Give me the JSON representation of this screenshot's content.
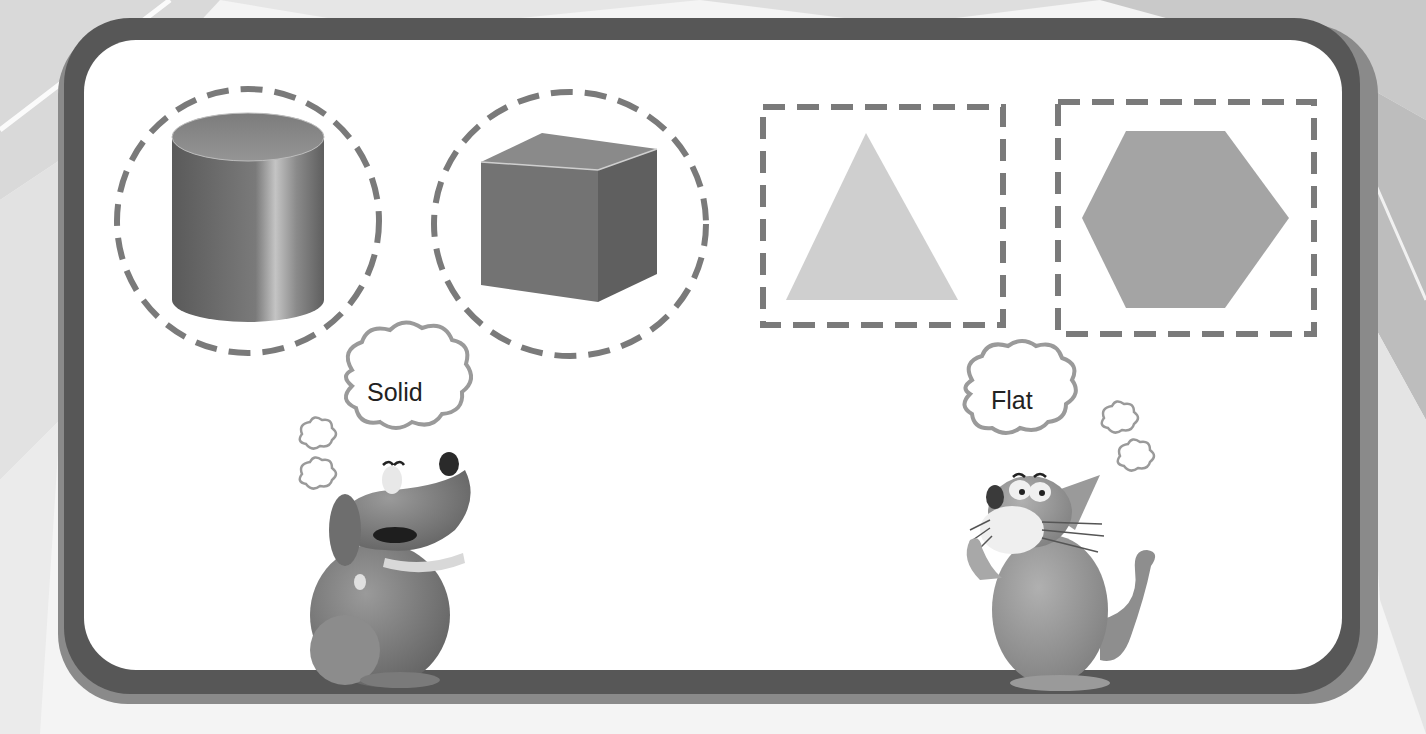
{
  "scene": {
    "description": "Worksheet illustration classifying shapes as solid or flat",
    "colors": {
      "frame_dark": "#575757",
      "frame_light": "#8a8a8a",
      "dash": "#7a7a7a",
      "panel": "#ffffff"
    }
  },
  "shapes": [
    {
      "name": "cylinder",
      "type": "solid",
      "outline": "dashed-circle"
    },
    {
      "name": "cube",
      "type": "solid",
      "outline": "dashed-circle"
    },
    {
      "name": "triangle",
      "type": "flat",
      "outline": "dashed-square"
    },
    {
      "name": "hexagon",
      "type": "flat",
      "outline": "dashed-square"
    }
  ],
  "characters": {
    "dog": {
      "thought": "Solid"
    },
    "cat": {
      "thought": "Flat"
    }
  }
}
